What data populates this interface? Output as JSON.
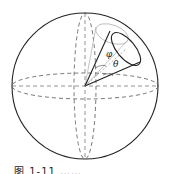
{
  "figure": {
    "labels": {
      "phi": "φ",
      "theta": "θ"
    },
    "caption": "图 1-11  ……",
    "colors": {
      "stroke": "#222222",
      "dashed": "#666666",
      "light": "#aaaaaa"
    }
  }
}
